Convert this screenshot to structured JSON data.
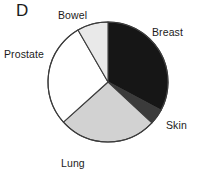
{
  "figure": {
    "panel_label": "D",
    "background_color": "#ffffff",
    "outline_color": "#3c3c3c"
  },
  "chart_data": {
    "type": "pie",
    "title": "D",
    "xlabel": "",
    "ylabel": "",
    "legend_position": "none",
    "grid": false,
    "labels_placement": "outside",
    "start_angle_deg": 0,
    "direction": "clockwise",
    "center": {
      "x": 108,
      "y": 82,
      "radius": 60
    },
    "categories": [
      "Breast",
      "Skin",
      "Lung",
      "Prostate",
      "Bowel"
    ],
    "values": [
      32.8,
      4.2,
      26.4,
      28.3,
      8.3
    ],
    "series": [
      {
        "name": "Cancer site share",
        "values": [
          32.8,
          4.2,
          26.4,
          28.3,
          8.3
        ]
      }
    ],
    "slices": [
      {
        "label": "Breast",
        "value": 32.8,
        "start_angle_deg": 0,
        "end_angle_deg": 118,
        "color": "#161616"
      },
      {
        "label": "Skin",
        "value": 4.2,
        "start_angle_deg": 118,
        "end_angle_deg": 133,
        "color": "#3b3b3b"
      },
      {
        "label": "Lung",
        "value": 26.4,
        "start_angle_deg": 133,
        "end_angle_deg": 228,
        "color": "#d2d2d2"
      },
      {
        "label": "Prostate",
        "value": 28.3,
        "start_angle_deg": 228,
        "end_angle_deg": 330,
        "color": "#ffffff"
      },
      {
        "label": "Bowel",
        "value": 8.3,
        "start_angle_deg": 330,
        "end_angle_deg": 360,
        "color": "#e9e9e9"
      }
    ]
  },
  "labels": {
    "bowel": "Bowel",
    "breast": "Breast",
    "skin": "Skin",
    "lung": "Lung",
    "prostate": "Prostate"
  }
}
